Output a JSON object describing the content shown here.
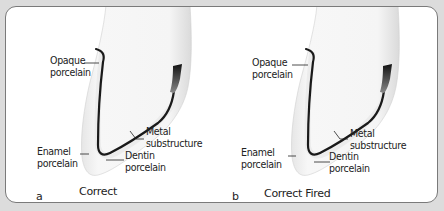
{
  "figure": {
    "background_color": "#dcdcdc",
    "panel_color": "#ffffff",
    "metal_color": "#1a1a1a",
    "panels": [
      {
        "letter": "a",
        "caption": "Correct",
        "labels": {
          "opaque": "Opaque\nporcelain",
          "metal": "Metal\nsubstructure",
          "enamel": "Enamel\nporcelain",
          "dentin": "Dentin\nporcelain"
        }
      },
      {
        "letter": "b",
        "caption": "Correct Fired",
        "labels": {
          "opaque": "Opaque\nporcelain",
          "metal": "Metal\nsubstructure",
          "enamel": "Enamel\nporcelain",
          "dentin": "Dentin\nporcelain"
        }
      }
    ]
  }
}
